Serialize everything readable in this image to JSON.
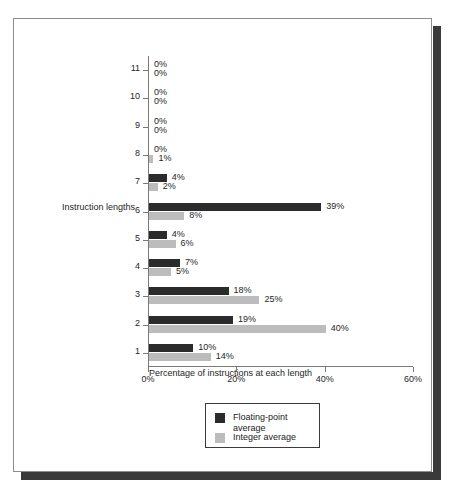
{
  "chart_data": {
    "type": "bar",
    "orientation": "horizontal",
    "title": "",
    "xlabel": "Percentage of instructions at each length",
    "ylabel": "Instruction lengths",
    "categories": [
      "1",
      "2",
      "3",
      "4",
      "5",
      "6",
      "7",
      "8",
      "9",
      "10",
      "11"
    ],
    "xlim": [
      0,
      60
    ],
    "xticks": [
      0,
      20,
      40,
      60
    ],
    "xtick_labels": [
      "0%",
      "20%",
      "40%",
      "60%"
    ],
    "grid": false,
    "legend_position": "bottom-center",
    "series": [
      {
        "name": "Floating-point average",
        "color": "#2b2b2b",
        "values": [
          10,
          19,
          18,
          7,
          4,
          39,
          4,
          0,
          0,
          0,
          0
        ],
        "value_labels": [
          "10%",
          "19%",
          "18%",
          "7%",
          "4%",
          "39%",
          "4%",
          "0%",
          "0%",
          "0%",
          "0%"
        ]
      },
      {
        "name": "Integer average",
        "color": "#bcbcbc",
        "values": [
          14,
          40,
          25,
          5,
          6,
          8,
          2,
          1,
          0,
          0,
          0
        ],
        "value_labels": [
          "14%",
          "40%",
          "25%",
          "5%",
          "6%",
          "8%",
          "2%",
          "1%",
          "0%",
          "0%",
          "0%"
        ]
      }
    ]
  },
  "legend": {
    "entries": [
      {
        "label": "Floating-point\naverage",
        "swatch": "fp"
      },
      {
        "label": "Integer average",
        "swatch": "int"
      }
    ]
  }
}
